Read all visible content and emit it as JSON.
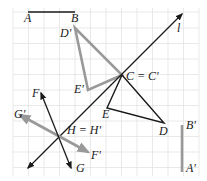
{
  "diagram": {
    "type": "geometry-transformations",
    "colors": {
      "grid": "#e3e3e3",
      "original": "#1a1a1a",
      "image": "#999999",
      "background": "#ffffff"
    },
    "labels": {
      "A": "A",
      "B": "B",
      "D_prime": "D'",
      "l": "l",
      "C_eq": "C = C'",
      "E_prime": "E'",
      "E": "E",
      "D": "D",
      "B_prime": "B'",
      "A_prime": "A'",
      "F": "F",
      "G_prime": "G'",
      "H_eq": "H = H'",
      "F_prime": "F'",
      "G": "G"
    },
    "elements": [
      {
        "name": "segment-AB",
        "from": "A",
        "to": "B",
        "color": "black"
      },
      {
        "name": "segment-A'B'",
        "from": "A'",
        "to": "B'",
        "color": "gray"
      },
      {
        "name": "triangle-CDE",
        "vertices": [
          "C",
          "D",
          "E"
        ],
        "color": "black"
      },
      {
        "name": "triangle-C'D'E'",
        "vertices": [
          "C'",
          "D'",
          "E'"
        ],
        "color": "gray"
      },
      {
        "name": "line-l",
        "type": "line with arrows",
        "color": "black"
      },
      {
        "name": "line-FG",
        "type": "line with arrows",
        "color": "black"
      },
      {
        "name": "line-F'G'",
        "type": "line with arrows",
        "color": "gray"
      }
    ]
  }
}
